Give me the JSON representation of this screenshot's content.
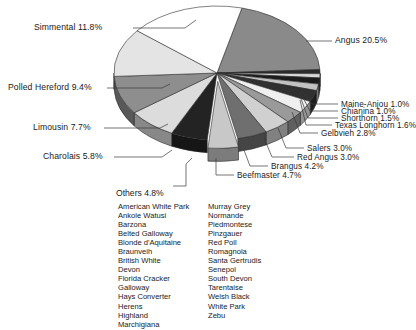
{
  "chart_data": {
    "type": "pie",
    "title": "",
    "xlabel": "",
    "ylabel": "",
    "units": "percent",
    "style": "3d-pie-exploded",
    "legend_position": "callout-labels",
    "grid": false,
    "categories": [
      "Angus",
      "Maine-Anjou",
      "Chianina",
      "Shorthorn",
      "Texas Longhorn",
      "Gelbvieh",
      "Salers",
      "Red Angus",
      "Brangus",
      "Beefmaster",
      "Others",
      "Charolais",
      "Limousin",
      "Polled Hereford",
      "Simmental",
      "Hereford"
    ],
    "values": [
      20.5,
      1.0,
      1.0,
      1.5,
      1.6,
      2.8,
      3.0,
      3.0,
      4.2,
      4.7,
      4.8,
      5.8,
      7.7,
      9.4,
      11.8,
      18.2
    ],
    "slices": [
      {
        "label": "Angus",
        "value": 20.5,
        "display": "Angus  20.5%",
        "color": "#8a8a8a"
      },
      {
        "label": "Maine-Anjou",
        "value": 1.0,
        "display": "Maine-Anjou  1.0%",
        "color": "#2b2b2b"
      },
      {
        "label": "Chianina",
        "value": 1.0,
        "display": "Chianina  1.0%",
        "color": "#d8d8d8"
      },
      {
        "label": "Shorthorn",
        "value": 1.5,
        "display": "Shorthorn  1.5%",
        "color": "#1c1c1c"
      },
      {
        "label": "Texas Longhorn",
        "value": 1.6,
        "display": "Texas Longhorn  1.6%",
        "color": "#c2c2c2"
      },
      {
        "label": "Gelbvieh",
        "value": 2.8,
        "display": "Gelbvieh  2.8%",
        "color": "#303030"
      },
      {
        "label": "Salers",
        "value": 3.0,
        "display": "Salers  3.0%",
        "color": "#efefef"
      },
      {
        "label": "Red Angus",
        "value": 3.0,
        "display": "Red Angus  3.0%",
        "color": "#9a9a9a"
      },
      {
        "label": "Brangus",
        "value": 4.2,
        "display": "Brangus  4.2%",
        "color": "#d0d0d0"
      },
      {
        "label": "Beefmaster",
        "value": 4.7,
        "display": "Beefmaster  4.7%",
        "color": "#6f6f6f"
      },
      {
        "label": "Others",
        "value": 4.8,
        "display": "Others  4.8%",
        "color": "#c8c8c8"
      },
      {
        "label": "Charolais",
        "value": 5.8,
        "display": "Charolais  5.8%",
        "color": "#232323"
      },
      {
        "label": "Limousin",
        "value": 7.7,
        "display": "Limousin  7.7%",
        "color": "#dcdcdc"
      },
      {
        "label": "Polled Hereford",
        "value": 9.4,
        "display": "Polled Hereford  9.4%",
        "color": "#8e8e8e"
      },
      {
        "label": "Simmental",
        "value": 11.8,
        "display": "Simmental  11.8%",
        "color": "#e4e4e4"
      },
      {
        "label": "Hereford",
        "value": 18.2,
        "display": "",
        "color": "#ffffff"
      }
    ]
  },
  "labels": {
    "simmental": "Simmental  11.8%",
    "polled_hereford": "Polled Hereford  9.4%",
    "limousin": "Limousin  7.7%",
    "charolais": "Charolais  5.8%",
    "angus": "Angus  20.5%",
    "maine_anjou": "Maine-Anjou  1.0%",
    "chianina": "Chianina  1.0%",
    "shorthorn": "Shorthorn  1.5%",
    "texas_longhorn": "Texas Longhorn  1.6%",
    "gelbvieh": "Gelbvieh  2.8%",
    "salers": "Salers  3.0%",
    "red_angus": "Red Angus  3.0%",
    "brangus": "Brangus  4.2%",
    "beefmaster": "Beefmaster  4.7%",
    "others": "Others  4.8%"
  },
  "others_breeds": {
    "column_left": [
      "American White Park",
      "Ankole Watusi",
      "Barzona",
      "Belted Galloway",
      "Blonde d'Aquitaine",
      "Braunveih",
      "British White",
      "Devon",
      "Florida Cracker",
      "Galloway",
      "Hays Converter",
      "Herens",
      "Highland",
      "Marchigiana"
    ],
    "column_right": [
      "Murray Grey",
      "Normande",
      "Piedmontese",
      "Pinzgauer",
      "Red Poll",
      "Romagnola",
      "Santa Gertrudis",
      "Senepol",
      "South Devon",
      "Tarentaise",
      "Welsh Black",
      "White Park",
      "Zebu"
    ]
  }
}
